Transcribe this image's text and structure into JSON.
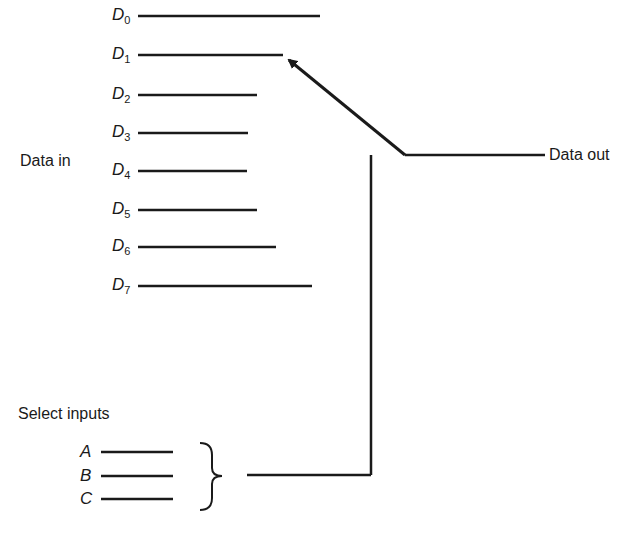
{
  "diagram": {
    "type": "multiplexer-block",
    "data_in_label": "Data in",
    "data_out_label": "Data out",
    "select_label": "Select inputs",
    "data_inputs": [
      {
        "name": "D",
        "sub": "0",
        "y": 16,
        "x_end": 320
      },
      {
        "name": "D",
        "sub": "1",
        "y": 55,
        "x_end": 283
      },
      {
        "name": "D",
        "sub": "2",
        "y": 95,
        "x_end": 257
      },
      {
        "name": "D",
        "sub": "3",
        "y": 133,
        "x_end": 248
      },
      {
        "name": "D",
        "sub": "4",
        "y": 171,
        "x_end": 247
      },
      {
        "name": "D",
        "sub": "5",
        "y": 210,
        "x_end": 257
      },
      {
        "name": "D",
        "sub": "6",
        "y": 247,
        "x_end": 276
      },
      {
        "name": "D",
        "sub": "7",
        "y": 286,
        "x_end": 312
      }
    ],
    "select_inputs": [
      "A",
      "B",
      "C"
    ],
    "selected_input": "D1",
    "line_color": "#1a1a1a"
  }
}
